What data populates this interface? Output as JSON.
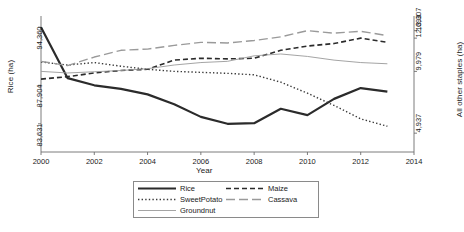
{
  "chart_data": {
    "type": "line",
    "title": "",
    "xlabel": "Year",
    "ylabel": "Rice (ha)",
    "ylabel_right": "All other staples (ha)",
    "x": [
      2000,
      2001,
      2002,
      2003,
      2004,
      2005,
      2006,
      2007,
      2008,
      2009,
      2010,
      2011,
      2012,
      2013
    ],
    "xlim": [
      2000,
      2014
    ],
    "xticks": [
      "2000",
      "2002",
      "2004",
      "2006",
      "2008",
      "2010",
      "2012",
      "2014"
    ],
    "xtick_values": [
      2000,
      2002,
      2004,
      2006,
      2008,
      2010,
      2012,
      2014
    ],
    "yticks_left": [
      "94,360",
      "87,904",
      "83,631"
    ],
    "ytick_left_values": [
      94360,
      87904,
      83631
    ],
    "ylim_left": [
      80500,
      95600
    ],
    "yticks_right": [
      "13,307",
      "12,693",
      "9,979",
      "4,937"
    ],
    "ytick_right_values": [
      13307,
      12693,
      9979,
      4937
    ],
    "ylim_right": [
      3400,
      14500
    ],
    "grid": false,
    "legend_position": "below-center",
    "series": [
      {
        "name": "Rice",
        "axis": "left",
        "style": "solid-thick",
        "color": "#2b2b2b",
        "values": [
          94360,
          88700,
          87904,
          87500,
          86900,
          85800,
          84400,
          83631,
          83700,
          85300,
          84600,
          86400,
          87600,
          87200
        ]
      },
      {
        "name": "Maize",
        "axis": "right",
        "style": "dashed",
        "color": "#2b2b2b",
        "values": [
          9350,
          9550,
          9850,
          10050,
          10150,
          10900,
          11050,
          11000,
          11050,
          11700,
          12050,
          12250,
          12693,
          12350
        ]
      },
      {
        "name": "SweetPotato",
        "axis": "right",
        "style": "dotted",
        "color": "#3a3a3a",
        "values": [
          10750,
          10500,
          10700,
          10400,
          10150,
          9979,
          9900,
          9820,
          9700,
          9100,
          8200,
          7200,
          6100,
          5500
        ]
      },
      {
        "name": "Cassava",
        "axis": "right",
        "style": "longdash",
        "color": "#9a9a9a",
        "values": [
          10800,
          10450,
          11150,
          11700,
          11800,
          12100,
          12350,
          12300,
          12500,
          12800,
          13307,
          13100,
          13250,
          12900
        ]
      },
      {
        "name": "Groundnut",
        "axis": "right",
        "style": "solid-thin",
        "color": "#9a9a9a",
        "values": [
          9979,
          9850,
          9950,
          10050,
          10200,
          10500,
          10700,
          10800,
          11250,
          11400,
          11200,
          10900,
          10700,
          10600
        ]
      }
    ]
  },
  "legend": {
    "entries": [
      {
        "label": "Rice",
        "style": "solid-thick",
        "color": "#2b2b2b"
      },
      {
        "label": "Maize",
        "style": "dashed",
        "color": "#2b2b2b"
      },
      {
        "label": "SweetPotato",
        "style": "dotted",
        "color": "#3a3a3a"
      },
      {
        "label": "Cassava",
        "style": "longdash",
        "color": "#9a9a9a"
      },
      {
        "label": "Groundnut",
        "style": "solid-thin",
        "color": "#9a9a9a"
      }
    ]
  },
  "axes": {
    "left_title": "Rice (ha)",
    "right_title": "All other staples (ha)",
    "x_title": "Year"
  },
  "colors": {
    "axis": "#6e6e6e",
    "dark_line": "#2b2b2b",
    "light_line": "#9a9a9a",
    "legend_border": "#8a8a8a",
    "background": "#ffffff"
  }
}
